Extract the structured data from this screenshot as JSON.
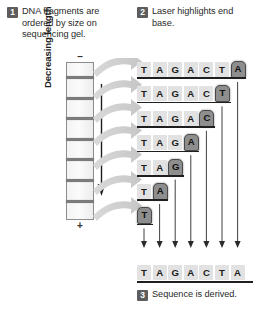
{
  "steps": [
    {
      "number": "1",
      "text": "DNA fragments are ordered by size on sequencing gel."
    },
    {
      "number": "2",
      "text": "Laser highlights end base."
    },
    {
      "number": "3",
      "text": "Sequence is derived."
    }
  ],
  "gel": {
    "top_electrode": "–",
    "bottom_electrode": "+",
    "axis_label": "Decreasing length",
    "band_count": 7
  },
  "ladder": {
    "rows": [
      {
        "bases": [
          "T",
          "A",
          "G",
          "A",
          "C",
          "T",
          "A"
        ],
        "highlight_index": 6
      },
      {
        "bases": [
          "T",
          "A",
          "G",
          "A",
          "C",
          "T"
        ],
        "highlight_index": 5
      },
      {
        "bases": [
          "T",
          "A",
          "G",
          "A",
          "C"
        ],
        "highlight_index": 4
      },
      {
        "bases": [
          "T",
          "A",
          "G",
          "A"
        ],
        "highlight_index": 3
      },
      {
        "bases": [
          "T",
          "A",
          "G"
        ],
        "highlight_index": 2
      },
      {
        "bases": [
          "T",
          "A"
        ],
        "highlight_index": 1
      },
      {
        "bases": [
          "T"
        ],
        "highlight_index": 0
      }
    ]
  },
  "final_sequence": {
    "bases": [
      "T",
      "A",
      "G",
      "A",
      "C",
      "T",
      "A"
    ]
  },
  "colors": {
    "badge": "#5d5d5d",
    "base_plain": "#e2e2e2",
    "base_highlight": "#8e8e8e",
    "gel_band": "#7b7b7b",
    "sweep_arrow": "#cfcfcf",
    "text": "#221f1f"
  }
}
